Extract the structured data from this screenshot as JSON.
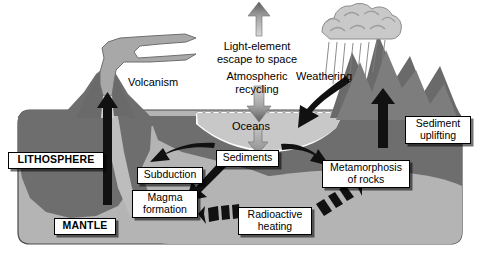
{
  "figure": {
    "background_color": "#ffffff"
  },
  "palette": {
    "lithosphere": "#6e6e6e",
    "mantle": "#b4b4b4",
    "ocean": "#c8c8c8",
    "slab": "#b0b0b0",
    "mountain_dark": "#6a6a6a",
    "mountain_mid": "#7d7d7d",
    "cloud": "#c9c9c9",
    "plume": "#a8a8a8",
    "arrow_black": "#111111",
    "arrow_gray": "#8a8a8a",
    "label_bg": "#ffffff",
    "label_border": "#000000",
    "outline": "#3a3a3a"
  },
  "plain_labels": [
    {
      "id": "volcanism",
      "text": "Volcanism",
      "x": 118,
      "y": 76,
      "w": 70,
      "size": 11.5
    },
    {
      "id": "light-element",
      "text": "Light-element\nescape to space",
      "x": 203,
      "y": 40,
      "w": 108,
      "size": 11.5
    },
    {
      "id": "atmospheric",
      "text": "Atmospheric\nrecycling",
      "x": 208,
      "y": 70,
      "w": 98,
      "size": 11.5
    },
    {
      "id": "weathering",
      "text": "Weathering",
      "x": 287,
      "y": 70,
      "w": 74,
      "size": 11.5
    },
    {
      "id": "oceans",
      "text": "Oceans",
      "x": 226,
      "y": 120,
      "w": 50,
      "size": 11.5
    }
  ],
  "boxed_labels": [
    {
      "id": "lithosphere",
      "text": "LITHOSPHERE",
      "x": 8,
      "y": 152,
      "w": 96,
      "bold": true
    },
    {
      "id": "mantle",
      "text": "MANTLE",
      "x": 54,
      "y": 218,
      "w": 62,
      "bold": true
    },
    {
      "id": "subduction",
      "text": "Subduction",
      "x": 137,
      "y": 167,
      "w": 66,
      "bold": false
    },
    {
      "id": "magma-formation",
      "text": "Magma\nformation",
      "x": 132,
      "y": 190,
      "w": 66,
      "bold": false
    },
    {
      "id": "sediments",
      "text": "Sediments",
      "x": 216,
      "y": 150,
      "w": 63,
      "bold": false
    },
    {
      "id": "metamorphosis",
      "text": "Metamorphosis\nof rocks",
      "x": 322,
      "y": 160,
      "w": 88,
      "bold": false
    },
    {
      "id": "radioactive-heating",
      "text": "Radioactive\nheating",
      "x": 238,
      "y": 207,
      "w": 74,
      "bold": false
    },
    {
      "id": "sediment-uplifting",
      "text": "Sediment\nuplifting",
      "x": 405,
      "y": 116,
      "w": 66,
      "bold": false
    }
  ],
  "flows": [
    {
      "id": "magma-to-volcano",
      "from": "Magma formation",
      "to": "Volcanism",
      "style": "black-solid-up"
    },
    {
      "id": "volcano-to-sky",
      "from": "Volcanism",
      "to": "Atmosphere",
      "style": "gray-plume"
    },
    {
      "id": "escape-to-space",
      "from": "Atmosphere",
      "to": "Space",
      "style": "gray-arrow-up"
    },
    {
      "id": "atmos-to-oceans",
      "from": "Atmosphere",
      "to": "Oceans",
      "style": "gray-arrow-down"
    },
    {
      "id": "rain-weathering",
      "from": "Clouds",
      "to": "Mountains",
      "style": "black-curved-down"
    },
    {
      "id": "oceans-to-sediments",
      "from": "Oceans",
      "to": "Sediments",
      "style": "gray-arrow-down"
    },
    {
      "id": "sediments-to-subduction",
      "from": "Sediments",
      "to": "Subduction",
      "style": "black-solid-left"
    },
    {
      "id": "sediments-to-magma",
      "from": "Sediments",
      "to": "Magma formation",
      "style": "black-solid-downleft"
    },
    {
      "id": "sediments-to-metamorphosis",
      "from": "Sediments",
      "to": "Metamorphosis of rocks",
      "style": "black-solid-right"
    },
    {
      "id": "uplift-arrow",
      "from": "Sediments",
      "to": "Sediment uplifting",
      "style": "black-solid-up"
    },
    {
      "id": "radioactive-left",
      "from": "Radioactive heating",
      "to": "Mantle",
      "style": "dashed-arrow-left"
    },
    {
      "id": "radioactive-right",
      "from": "Radioactive heating",
      "to": "Mantle",
      "style": "dashed-arrow-right"
    }
  ]
}
